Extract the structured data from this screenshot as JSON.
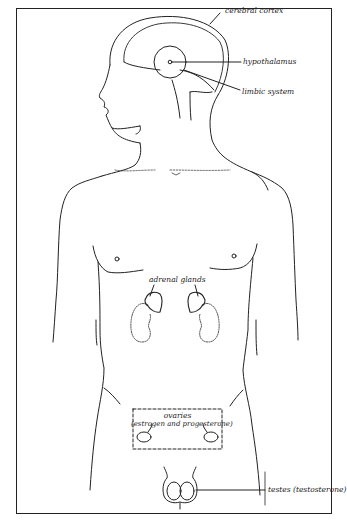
{
  "diagram": {
    "type": "anatomical-illustration",
    "labels": {
      "cerebral_cortex": "cerebral cortex",
      "hypothalamus": "hypothalamus",
      "limbic_system": "limbic system",
      "adrenal_glands": "adrenal glands",
      "ovaries_title": "ovaries",
      "ovaries_hormones": "(estrogen and progesterone)",
      "testes": "testes (testosterone)"
    },
    "colors": {
      "line": "#222222",
      "background": "#ffffff"
    }
  }
}
